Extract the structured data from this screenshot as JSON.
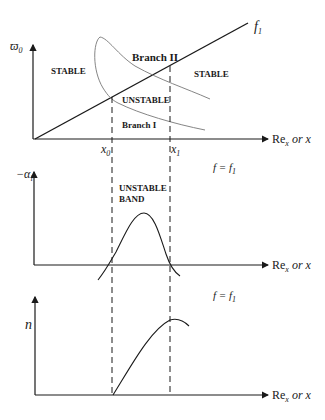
{
  "diagram": {
    "panel_top": {
      "y_axis_label": "ϖ",
      "y_axis_sub": "0",
      "x_axis_label": "Re",
      "x_axis_sub": "x",
      "x_axis_suffix": " or x",
      "line_label": "f",
      "line_label_sub": "1",
      "regions": {
        "stable_left": "STABLE",
        "stable_right": "STABLE",
        "unstable": "UNSTABLE",
        "branch_1": "Branch I",
        "branch_2": "Branch II"
      },
      "ticks": {
        "x0": "x",
        "x0_sub": "0",
        "x1": "x",
        "x1_sub": "1"
      }
    },
    "panel_middle": {
      "y_axis_label": "−α",
      "y_axis_sub": "i",
      "x_axis_label": "Re",
      "x_axis_sub": "x",
      "x_axis_suffix": " or x",
      "condition": "f = f",
      "condition_sub": "1",
      "band_label_1": "UNSTABLE",
      "band_label_2": "BAND"
    },
    "panel_bottom": {
      "y_axis_label": "n",
      "x_axis_label": "Re",
      "x_axis_sub": "x",
      "x_axis_suffix": " or x",
      "condition": "f = f",
      "condition_sub": "1"
    }
  },
  "colors": {
    "ink": "#1a1a1a",
    "thin": "#555555"
  }
}
